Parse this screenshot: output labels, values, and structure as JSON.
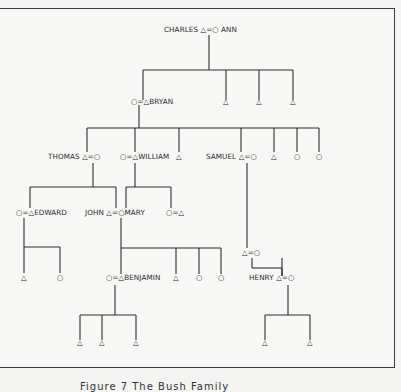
{
  "figure": {
    "caption": "Figure 7  The Bush Family",
    "symbols": {
      "male": "△",
      "female": "○",
      "marriage": "="
    }
  },
  "people": {
    "charles": "CHARLES",
    "ann": "ANN",
    "bryan": "BRYAN",
    "thomas": "THOMAS",
    "william": "WILLIAM",
    "samuel": "SAMUEL",
    "edward": "EDWARD",
    "john": "JOHN",
    "mary": "MARY",
    "benjamin": "BENJAMIN",
    "henry": "HENRY"
  },
  "generations": [
    {
      "level": 1,
      "couples": [
        "CHARLES △=○ ANN"
      ]
    },
    {
      "level": 2,
      "children_of": "CHARLES & ANN",
      "members": [
        "○=△ BRYAN",
        "△",
        "△",
        "△"
      ]
    },
    {
      "level": 3,
      "children_of": "BRYAN",
      "members": [
        "THOMAS △=○",
        "○=△ WILLIAM",
        "△",
        "SAMUEL △=○",
        "△",
        "○",
        "○"
      ]
    },
    {
      "level": 4,
      "members": [
        "○=△ EDWARD",
        "JOHN △=○ MARY",
        "○=△",
        "△=○"
      ]
    },
    {
      "level": 5,
      "members": [
        "△",
        "○",
        "○=△ BENJAMIN",
        "△",
        "○",
        "○",
        "HENRY △=○"
      ]
    },
    {
      "level": 6,
      "members": [
        "△",
        "△",
        "△",
        "△",
        "△"
      ]
    }
  ]
}
